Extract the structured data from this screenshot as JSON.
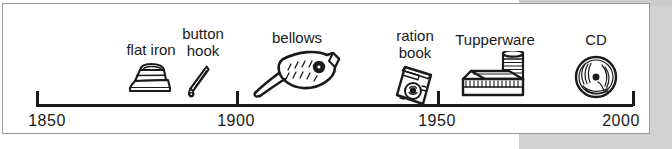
{
  "figure": {
    "type": "timeline",
    "orientation": "horizontal",
    "axis": {
      "start_year": 1850,
      "end_year": 2000,
      "ticks": [
        {
          "label": "1850",
          "year": 1850,
          "x": 33
        },
        {
          "label": "1900",
          "year": 1900,
          "x": 233
        },
        {
          "label": "1950",
          "year": 1950,
          "x": 434
        },
        {
          "label": "2000",
          "year": 2000,
          "x": 629
        }
      ]
    },
    "items": [
      {
        "label": "flat iron",
        "icon": "flat-iron-icon",
        "x": 148,
        "label_lines": 1,
        "approx_year": 1879
      },
      {
        "label": "button\nhook",
        "icon": "button-hook-icon",
        "x": 200,
        "label_lines": 2,
        "approx_year": 1892
      },
      {
        "label": "bellows",
        "icon": "bellows-icon",
        "x": 294,
        "label_lines": 1,
        "approx_year": 1915
      },
      {
        "label": "ration\nbook",
        "icon": "ration-book-icon",
        "x": 412,
        "label_lines": 2,
        "approx_year": 1944
      },
      {
        "label": "Tupperware",
        "icon": "tupperware-icon",
        "x": 492,
        "label_lines": 1,
        "approx_year": 1959
      },
      {
        "label": "CD",
        "icon": "cd-icon",
        "x": 593,
        "label_lines": 1,
        "approx_year": 1984
      }
    ],
    "colors": {
      "ink": "#1a1a1a",
      "frame": "#9a9a9a",
      "page": "#ffffff",
      "surround_grey": "#d2d2d2"
    }
  }
}
